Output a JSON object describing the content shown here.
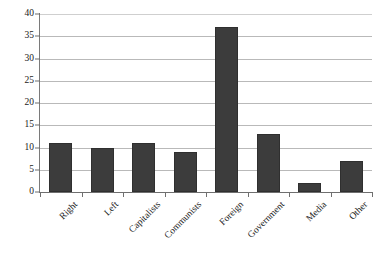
{
  "chart_data": {
    "type": "bar",
    "title": "",
    "subtitle": "",
    "xlabel": "",
    "ylabel": "",
    "categories": [
      "Right",
      "Left",
      "Capitalists",
      "Communists",
      "Foreign",
      "Government",
      "Media",
      "Other"
    ],
    "values": [
      11,
      10,
      11,
      9,
      37,
      13,
      2,
      7
    ],
    "ylim": [
      0,
      40
    ],
    "y_ticks": [
      0,
      5,
      10,
      15,
      20,
      25,
      30,
      35,
      40
    ],
    "y_tick_labels": [
      "0",
      "5",
      "10",
      "15",
      "20",
      "25",
      "30",
      "35",
      "40"
    ],
    "grid": true,
    "grid_axis": "y",
    "legend": false,
    "legend_position": "none",
    "bar_color": "#3c3c3c",
    "bar_edge_color": "#2f2f2f",
    "gridline_color": "#b9b9b9",
    "axis_color": "#6f6f6f",
    "background_color": "#ffffff",
    "x_label_rotation": -45
  }
}
